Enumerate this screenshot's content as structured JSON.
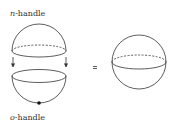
{
  "diagram": {
    "top_label": {
      "symbol": "n",
      "suffix": "-handle"
    },
    "bottom_label": {
      "symbol": "o",
      "suffix": "-handle"
    },
    "relation": "=",
    "stroke_color": "#333333"
  }
}
